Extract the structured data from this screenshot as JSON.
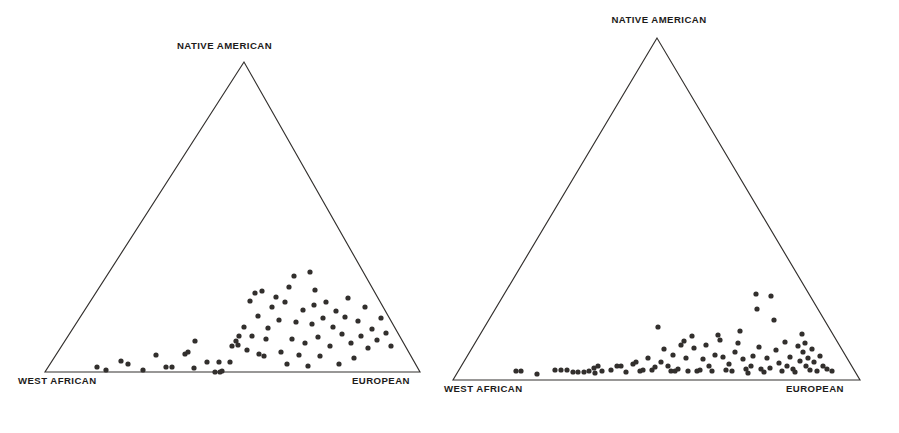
{
  "figure": {
    "background_color": "#ffffff",
    "point_color": "#322f2d",
    "line_color": "#33302e",
    "panel_count": 2
  },
  "panels": [
    {
      "id": "left",
      "name": "ternary-plot-left",
      "labels": {
        "top": "NATIVE AMERICAN",
        "bottom_left": "WEST AFRICAN",
        "bottom_right": "EUROPEAN"
      }
    },
    {
      "id": "right",
      "name": "ternary-plot-right",
      "labels": {
        "top": "NATIVE AMERICAN",
        "bottom_left": "WEST AFRICAN",
        "bottom_right": "EUROPEAN"
      }
    }
  ],
  "chart_data": [
    {
      "type": "scatter",
      "plot_id": "left",
      "subtype": "ternary",
      "title": "",
      "xlabel": "",
      "ylabel": "",
      "grid": false,
      "legend": "none",
      "axes": [
        {
          "name": "Native American",
          "vertex": "top",
          "range": [
            0,
            100
          ]
        },
        {
          "name": "West African",
          "vertex": "bottom-left",
          "range": [
            0,
            100
          ]
        },
        {
          "name": "European",
          "vertex": "bottom-right",
          "range": [
            0,
            100
          ]
        }
      ],
      "vertices_px": {
        "top": [
          244,
          62
        ],
        "bottom_left": [
          45,
          372
        ],
        "bottom_right": [
          420,
          372
        ]
      },
      "n_points": 73,
      "points_px": [
        [
          97,
          367
        ],
        [
          106,
          370
        ],
        [
          121,
          361
        ],
        [
          128,
          364
        ],
        [
          143,
          370
        ],
        [
          156,
          355
        ],
        [
          166,
          367
        ],
        [
          172,
          367
        ],
        [
          185,
          354
        ],
        [
          188,
          352
        ],
        [
          194,
          368
        ],
        [
          195,
          341
        ],
        [
          207,
          362
        ],
        [
          215,
          372
        ],
        [
          219,
          362
        ],
        [
          220,
          372
        ],
        [
          222,
          371
        ],
        [
          230,
          362
        ],
        [
          232,
          346
        ],
        [
          236,
          341
        ],
        [
          238,
          345
        ],
        [
          239,
          336
        ],
        [
          244,
          327
        ],
        [
          247,
          350
        ],
        [
          250,
          301
        ],
        [
          252,
          336
        ],
        [
          255,
          293
        ],
        [
          258,
          316
        ],
        [
          259,
          354
        ],
        [
          262,
          291
        ],
        [
          264,
          356
        ],
        [
          266,
          339
        ],
        [
          268,
          328
        ],
        [
          272,
          307
        ],
        [
          276,
          297
        ],
        [
          279,
          320
        ],
        [
          281,
          352
        ],
        [
          285,
          302
        ],
        [
          287,
          364
        ],
        [
          289,
          287
        ],
        [
          292,
          339
        ],
        [
          294,
          276
        ],
        [
          296,
          322
        ],
        [
          299,
          355
        ],
        [
          303,
          310
        ],
        [
          305,
          343
        ],
        [
          308,
          366
        ],
        [
          310,
          272
        ],
        [
          312,
          324
        ],
        [
          314,
          305
        ],
        [
          315,
          290
        ],
        [
          318,
          337
        ],
        [
          320,
          356
        ],
        [
          323,
          318
        ],
        [
          326,
          302
        ],
        [
          330,
          346
        ],
        [
          333,
          327
        ],
        [
          336,
          311
        ],
        [
          339,
          364
        ],
        [
          342,
          334
        ],
        [
          345,
          317
        ],
        [
          348,
          298
        ],
        [
          351,
          343
        ],
        [
          354,
          358
        ],
        [
          358,
          321
        ],
        [
          361,
          336
        ],
        [
          365,
          307
        ],
        [
          368,
          348
        ],
        [
          372,
          329
        ],
        [
          377,
          340
        ],
        [
          381,
          318
        ],
        [
          386,
          333
        ],
        [
          391,
          346
        ]
      ]
    },
    {
      "type": "scatter",
      "plot_id": "right",
      "subtype": "ternary",
      "title": "",
      "xlabel": "",
      "ylabel": "",
      "grid": false,
      "legend": "none",
      "axes": [
        {
          "name": "Native American",
          "vertex": "top",
          "range": [
            0,
            100
          ]
        },
        {
          "name": "West African",
          "vertex": "bottom-left",
          "range": [
            0,
            100
          ]
        },
        {
          "name": "European",
          "vertex": "bottom-right",
          "range": [
            0,
            100
          ]
        }
      ],
      "vertices_px": {
        "top": [
          657,
          38
        ],
        "bottom_left": [
          453,
          380
        ],
        "bottom_right": [
          860,
          380
        ]
      },
      "n_points": 92,
      "points_px": [
        [
          516,
          371
        ],
        [
          521,
          371
        ],
        [
          537,
          374
        ],
        [
          555,
          370
        ],
        [
          561,
          370
        ],
        [
          567,
          370
        ],
        [
          573,
          372
        ],
        [
          578,
          372
        ],
        [
          584,
          372
        ],
        [
          589,
          371
        ],
        [
          594,
          368
        ],
        [
          595,
          373
        ],
        [
          598,
          366
        ],
        [
          602,
          371
        ],
        [
          611,
          370
        ],
        [
          617,
          366
        ],
        [
          621,
          366
        ],
        [
          626,
          372
        ],
        [
          633,
          364
        ],
        [
          636,
          362
        ],
        [
          640,
          371
        ],
        [
          643,
          370
        ],
        [
          648,
          358
        ],
        [
          652,
          370
        ],
        [
          655,
          367
        ],
        [
          658,
          327
        ],
        [
          661,
          362
        ],
        [
          664,
          349
        ],
        [
          668,
          366
        ],
        [
          671,
          371
        ],
        [
          673,
          355
        ],
        [
          675,
          371
        ],
        [
          678,
          369
        ],
        [
          681,
          345
        ],
        [
          684,
          341
        ],
        [
          686,
          358
        ],
        [
          688,
          371
        ],
        [
          692,
          336
        ],
        [
          694,
          348
        ],
        [
          697,
          371
        ],
        [
          700,
          370
        ],
        [
          703,
          359
        ],
        [
          706,
          345
        ],
        [
          709,
          366
        ],
        [
          712,
          371
        ],
        [
          715,
          355
        ],
        [
          718,
          335
        ],
        [
          720,
          340
        ],
        [
          723,
          357
        ],
        [
          726,
          370
        ],
        [
          729,
          364
        ],
        [
          732,
          371
        ],
        [
          735,
          352
        ],
        [
          738,
          343
        ],
        [
          740,
          331
        ],
        [
          743,
          359
        ],
        [
          746,
          369
        ],
        [
          748,
          373
        ],
        [
          751,
          366
        ],
        [
          753,
          356
        ],
        [
          756,
          294
        ],
        [
          757,
          309
        ],
        [
          759,
          347
        ],
        [
          761,
          369
        ],
        [
          764,
          372
        ],
        [
          767,
          358
        ],
        [
          770,
          368
        ],
        [
          771,
          296
        ],
        [
          774,
          320
        ],
        [
          776,
          350
        ],
        [
          779,
          363
        ],
        [
          782,
          371
        ],
        [
          785,
          342
        ],
        [
          787,
          366
        ],
        [
          790,
          357
        ],
        [
          793,
          369
        ],
        [
          795,
          372
        ],
        [
          798,
          346
        ],
        [
          800,
          361
        ],
        [
          802,
          334
        ],
        [
          803,
          352
        ],
        [
          805,
          343
        ],
        [
          806,
          366
        ],
        [
          808,
          358
        ],
        [
          810,
          370
        ],
        [
          812,
          349
        ],
        [
          814,
          362
        ],
        [
          817,
          371
        ],
        [
          820,
          356
        ],
        [
          823,
          366
        ],
        [
          827,
          369
        ],
        [
          832,
          371
        ]
      ]
    }
  ]
}
